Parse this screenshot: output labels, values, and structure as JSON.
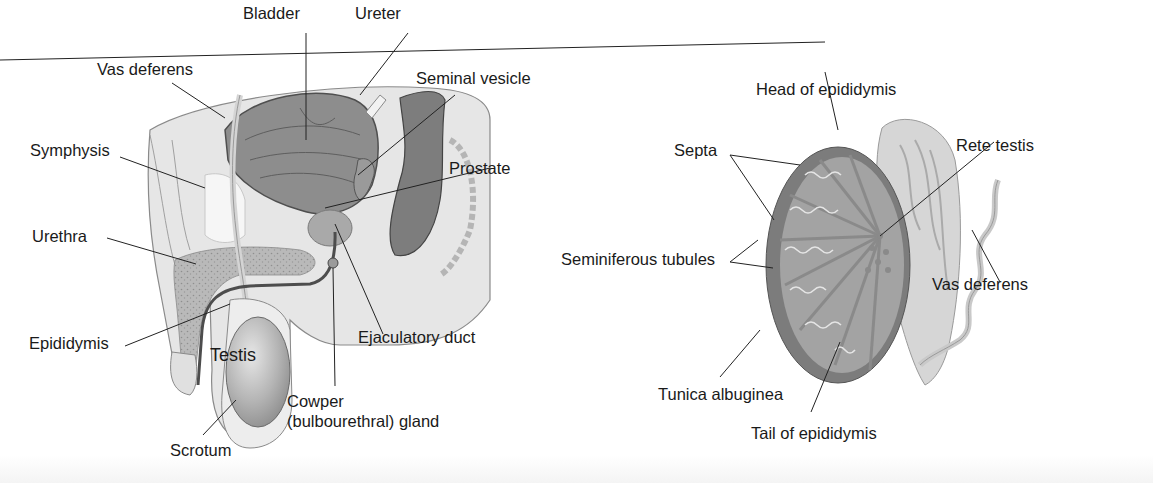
{
  "figure": {
    "left_panel": {
      "name": "sagittal-section-male-pelvis",
      "labels": {
        "bladder": "Bladder",
        "ureter": "Ureter",
        "vas_deferens": "Vas deferens",
        "seminal_vesicle": "Seminal vesicle",
        "symphysis": "Symphysis",
        "prostate": "Prostate",
        "urethra": "Urethra",
        "epididymis": "Epididymis",
        "testis": "Testis",
        "ejaculatory_duct": "Ejaculatory duct",
        "cowper_line1": "Cowper",
        "cowper_line2": "(bulbourethral) gland",
        "scrotum": "Scrotum"
      }
    },
    "right_panel": {
      "name": "testis-cross-section",
      "labels": {
        "head_of_epididymis": "Head of epididymis",
        "septa": "Septa",
        "rete_testis": "Rete testis",
        "seminiferous_tubules": "Seminiferous tubules",
        "vas_deferens": "Vas deferens",
        "tunica_albuginea": "Tunica albuginea",
        "tail_of_epididymis": "Tail of epididymis"
      }
    },
    "colors": {
      "body_fill": "#e4e4e4",
      "organ_dark": "#8c8c8c",
      "organ_mid": "#a8a8a8",
      "tissue_light": "#cfcfcf",
      "outline": "#555555",
      "leader_line": "#222222"
    }
  }
}
